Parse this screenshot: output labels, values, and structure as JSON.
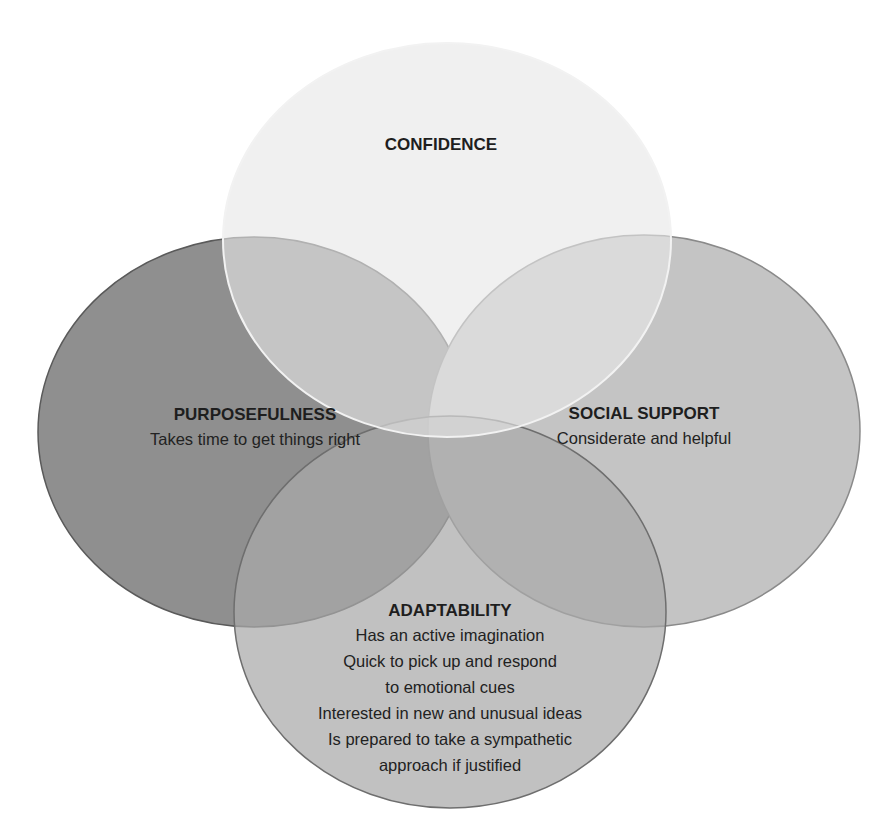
{
  "diagram": {
    "type": "venn",
    "sets": [
      {
        "id": "purposefulness",
        "title": "PURPOSEFULNESS",
        "lines": [
          "Takes time to get things right"
        ],
        "fill": "#8f8f8f",
        "stroke": "#5a5a5a"
      },
      {
        "id": "social-support",
        "title": "SOCIAL SUPPORT",
        "lines": [
          "Considerate and helpful"
        ],
        "fill": "#c4c4c4",
        "stroke": "#8a8a8a"
      },
      {
        "id": "adaptability",
        "title": "ADAPTABILITY",
        "lines": [
          "Has an active imagination",
          "Quick to pick up and respond",
          "to emotional cues",
          "Interested in new and unusual ideas",
          "Is prepared to take a sympathetic",
          "approach if justified"
        ],
        "fill": "#a9a9a9",
        "stroke": "#6e6e6e"
      },
      {
        "id": "confidence",
        "title": "CONFIDENCE",
        "lines": [],
        "fill": "#e6e6e6",
        "stroke": "#f2f2f2"
      }
    ]
  }
}
